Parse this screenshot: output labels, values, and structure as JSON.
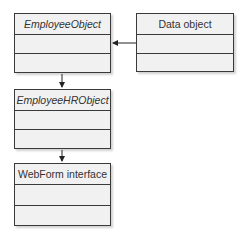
{
  "diagram": {
    "type": "class-diagram",
    "classes": [
      {
        "id": "employee-object",
        "name": "EmployeeObject",
        "italic": true
      },
      {
        "id": "data-object",
        "name": "Data object",
        "italic": false
      },
      {
        "id": "employee-hr-object",
        "name": "EmployeeHRObject",
        "italic": true
      },
      {
        "id": "webform-interface",
        "name": "WebForm interface",
        "italic": false
      }
    ],
    "relations": [
      {
        "from": "data-object",
        "to": "employee-object",
        "type": "arrow"
      },
      {
        "from": "employee-object",
        "to": "employee-hr-object",
        "type": "arrow"
      },
      {
        "from": "employee-hr-object",
        "to": "webform-interface",
        "type": "arrow"
      }
    ]
  }
}
